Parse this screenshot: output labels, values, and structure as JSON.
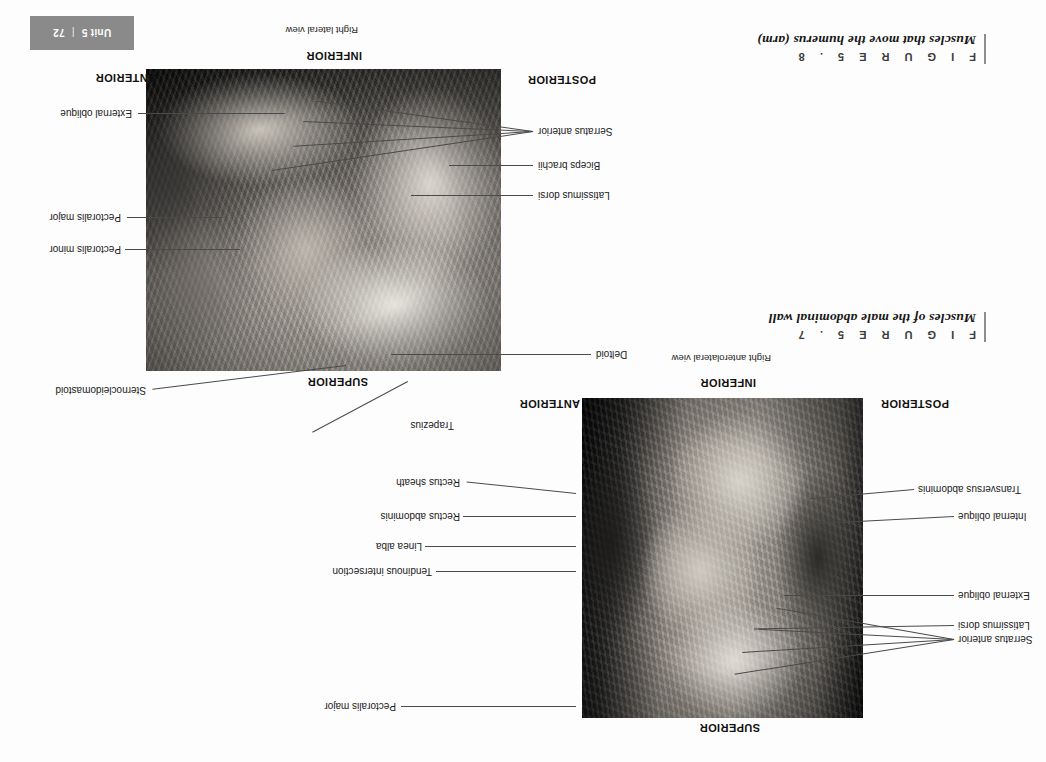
{
  "page": {
    "unit_label": "Unit 5",
    "separator": "|",
    "page_number": "72",
    "tab_color": "#8a8a8a",
    "background": "#ffffff",
    "rotation_degrees": 180
  },
  "figures": [
    {
      "id": "figure-5-8",
      "number": "F I G U R E   5 . 8",
      "title": "Muscles that move the humerus (arm)",
      "view": "Right lateral view",
      "orientation": {
        "top": "INFERIOR",
        "bottom": "SUPERIOR",
        "left": "ANTERIOR",
        "right": "POSTERIOR"
      },
      "labels": [
        "External oblique",
        "Pectoralis major",
        "Pectoralis minor",
        "Sternocleidomastoid",
        "Trapezius",
        "Serratus anterior",
        "Biceps brachii",
        "Latissimus dorsi",
        "Deltoid"
      ]
    },
    {
      "id": "figure-5-7",
      "number": "F I G U R E   5 . 7",
      "title": "Muscles of the male abdominal wall",
      "view": "Right anterolateral view",
      "orientation": {
        "top": "INFERIOR",
        "bottom": "SUPERIOR",
        "left": "ANTERIOR",
        "right": "POSTERIOR"
      },
      "labels": [
        "Rectus sheath",
        "Rectus abdominis",
        "Linea alba",
        "Tendinous intersection",
        "Pectoralis major",
        "Transversus abdominis",
        "Internal oblique",
        "External oblique",
        "Latissimus dorsi",
        "Serratus anterior"
      ]
    }
  ]
}
